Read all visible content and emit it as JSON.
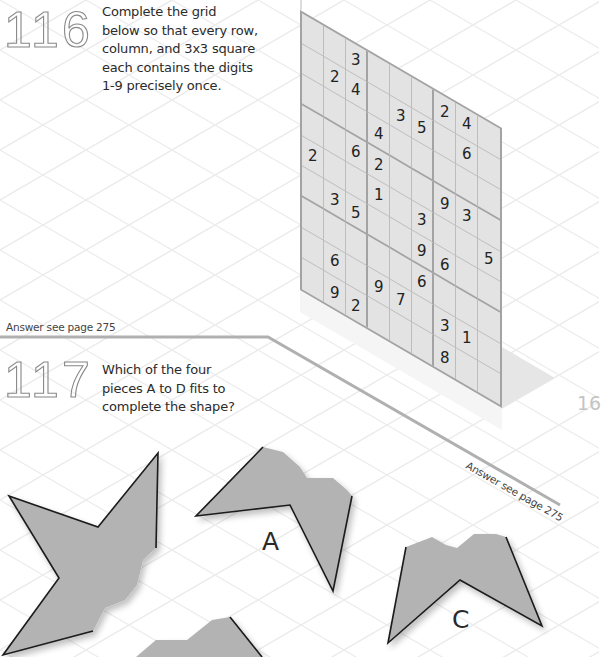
{
  "puzzle_116": {
    "number": "116",
    "prompt_lines": [
      "Complete the grid",
      "below so that every row,",
      "column, and 3x3 square",
      "each contains the digits",
      "1-9 precisely once."
    ],
    "answer_ref": "Answer see page 275",
    "grid": [
      [
        "",
        "",
        "3",
        "",
        "",
        "",
        "2",
        "4",
        ""
      ],
      [
        "",
        "2",
        "4",
        "",
        "3",
        "5",
        "",
        "6",
        ""
      ],
      [
        "",
        "",
        "",
        "4",
        "",
        "",
        "",
        "",
        ""
      ],
      [
        "",
        "",
        "6",
        "2",
        "",
        "",
        "9",
        "3",
        ""
      ],
      [
        "2",
        "",
        "",
        "1",
        "",
        "3",
        "",
        "",
        "5"
      ],
      [
        "",
        "3",
        "5",
        "",
        "",
        "9",
        "6",
        "",
        ""
      ],
      [
        "",
        "",
        "",
        "",
        "",
        "6",
        "",
        "",
        ""
      ],
      [
        "",
        "6",
        "",
        "9",
        "7",
        "",
        "3",
        "1",
        ""
      ],
      [
        "",
        "9",
        "2",
        "",
        "",
        "",
        "8",
        "",
        ""
      ]
    ]
  },
  "puzzle_117": {
    "number": "117",
    "prompt_lines": [
      "Which of the four",
      "pieces A to D fits to",
      "complete the shape?"
    ],
    "answer_ref": "Answer see page 275",
    "pieces": [
      {
        "label": "A"
      },
      {
        "label": "C"
      }
    ]
  },
  "page": {
    "number_partial": "16"
  },
  "colors": {
    "shape_fill": "#b3b3b3",
    "grid_fill": "#e3e3e3",
    "grid_border": "#a3a3a3",
    "divider": "#b0b0b0"
  }
}
